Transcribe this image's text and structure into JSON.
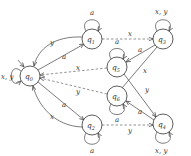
{
  "diagram": {
    "type": "finite-automaton",
    "initial_state": "q0",
    "states": [
      {
        "id": "q0",
        "label": "q0",
        "x": 30,
        "y": 76
      },
      {
        "id": "q1",
        "label": "q1",
        "x": 92,
        "y": 39
      },
      {
        "id": "q3",
        "label": "q3",
        "x": 163,
        "y": 39
      },
      {
        "id": "q5",
        "label": "q5",
        "x": 117,
        "y": 67
      },
      {
        "id": "q6",
        "label": "q6",
        "x": 117,
        "y": 96
      },
      {
        "id": "q2",
        "label": "q2",
        "x": 92,
        "y": 125
      },
      {
        "id": "q4",
        "label": "q4",
        "x": 163,
        "y": 124
      }
    ],
    "labels": {
      "q0": "q",
      "q1": "q",
      "q2": "q",
      "q3": "q",
      "q4": "q",
      "q5": "q",
      "q6": "q",
      "s0": "0",
      "s1": "1",
      "s2": "2",
      "s3": "3",
      "s4": "4",
      "s5": "5",
      "s6": "6",
      "loop_q0": "x, y",
      "loop_q1": "a",
      "loop_q3": "x, y",
      "loop_q5": "a",
      "loop_q6": "a",
      "loop_q2": "a",
      "loop_q4": "x, y",
      "q0_q1": "a",
      "q1_q0": "y",
      "q1_q3": "x",
      "q3_q5": "a",
      "q3_q6": "x",
      "q5_q0": "x",
      "q6_q0": "y",
      "q0_q2": "a",
      "q2_q0": "x",
      "q2_q4": "y",
      "q4_q6": "a",
      "q5_q4": "y"
    },
    "edges": [
      {
        "from": "q0",
        "to": "q0",
        "label": "x, y",
        "style": "solid"
      },
      {
        "from": "q1",
        "to": "q1",
        "label": "a",
        "style": "solid"
      },
      {
        "from": "q3",
        "to": "q3",
        "label": "x, y",
        "style": "solid"
      },
      {
        "from": "q5",
        "to": "q5",
        "label": "a",
        "style": "solid"
      },
      {
        "from": "q6",
        "to": "q6",
        "label": "a",
        "style": "solid"
      },
      {
        "from": "q2",
        "to": "q2",
        "label": "a",
        "style": "solid"
      },
      {
        "from": "q4",
        "to": "q4",
        "label": "x, y",
        "style": "solid"
      },
      {
        "from": "q0",
        "to": "q1",
        "label": "a",
        "style": "solid"
      },
      {
        "from": "q1",
        "to": "q0",
        "label": "y",
        "style": "solid"
      },
      {
        "from": "q1",
        "to": "q3",
        "label": "x",
        "style": "dashed"
      },
      {
        "from": "q3",
        "to": "q5",
        "label": "a",
        "style": "solid"
      },
      {
        "from": "q3",
        "to": "q6",
        "label": "x",
        "style": "solid"
      },
      {
        "from": "q5",
        "to": "q0",
        "label": "x",
        "style": "dashed"
      },
      {
        "from": "q6",
        "to": "q0",
        "label": "y",
        "style": "dashed"
      },
      {
        "from": "q0",
        "to": "q2",
        "label": "a",
        "style": "solid"
      },
      {
        "from": "q2",
        "to": "q0",
        "label": "x",
        "style": "solid"
      },
      {
        "from": "q2",
        "to": "q4",
        "label": "y",
        "style": "dashed"
      },
      {
        "from": "q4",
        "to": "q6",
        "label": "a",
        "style": "solid"
      },
      {
        "from": "q5",
        "to": "q4",
        "label": "y",
        "style": "solid"
      }
    ]
  }
}
